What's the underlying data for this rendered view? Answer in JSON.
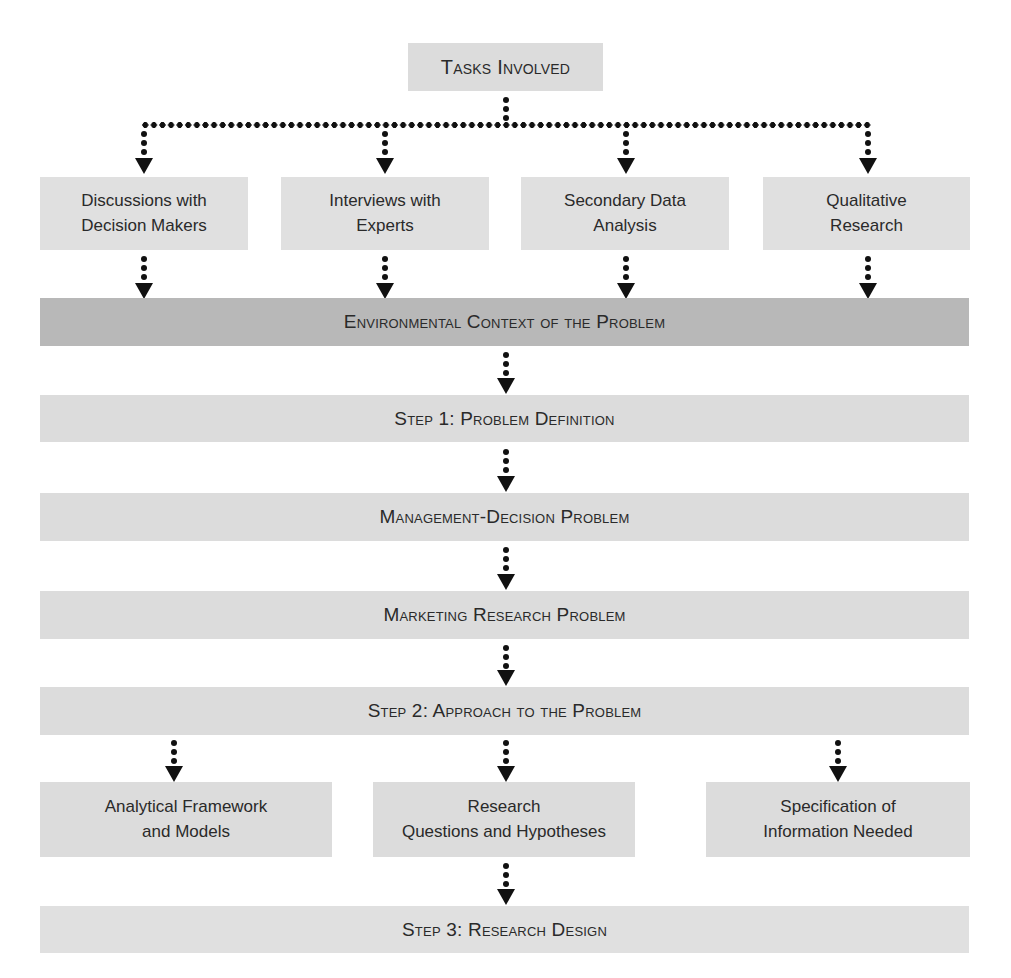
{
  "diagram": {
    "top": {
      "label": "Tasks Involved"
    },
    "tasks": [
      {
        "line1": "Discussions with",
        "line2": "Decision Makers"
      },
      {
        "line1": "Interviews with",
        "line2": "Experts"
      },
      {
        "line1": "Secondary Data",
        "line2": "Analysis"
      },
      {
        "line1": "Qualitative",
        "line2": "Research"
      }
    ],
    "environmental_context": {
      "label": "Environmental Context of the Problem"
    },
    "step1": {
      "label": "Step 1: Problem Definition"
    },
    "management_decision": {
      "label": "Management-Decision Problem"
    },
    "marketing_research": {
      "label": "Marketing Research Problem"
    },
    "step2": {
      "label": "Step 2: Approach to the Problem"
    },
    "approach_components": [
      {
        "line1": "Analytical Framework",
        "line2": "and Models"
      },
      {
        "line1": "Research",
        "line2": "Questions and Hypotheses"
      },
      {
        "line1": "Specification of",
        "line2": "Information Needed"
      }
    ],
    "step3": {
      "label": "Step 3: Research Design"
    },
    "colors": {
      "box_fill": "#dcdcdc",
      "highlight_fill": "#b8b8b8",
      "connector": "#111111"
    }
  }
}
